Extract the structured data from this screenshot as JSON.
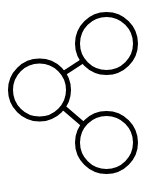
{
  "diagram": {
    "title": "share-network-diagram",
    "description": "Three outlined circles connected by two straight line segments forming a branching share icon",
    "type": "node-link",
    "canvas": {
      "width": 151,
      "height": 182
    },
    "colors": {
      "background": "#ffffff",
      "stroke": "#000000"
    },
    "stroke_width": 5,
    "nodes": [
      {
        "id": "node-left",
        "name": "left-circle",
        "label": "",
        "cx": 39.5,
        "cy": 90,
        "r": 29,
        "stroke": "#000000",
        "stroke_width": 5,
        "fill": "none"
      },
      {
        "id": "node-top-right",
        "name": "top-right-circle",
        "label": "",
        "cx": 106.5,
        "cy": 43.5,
        "r": 29,
        "stroke": "#000000",
        "stroke_width": 5,
        "fill": "none"
      },
      {
        "id": "node-bottom-right",
        "name": "bottom-right-circle",
        "label": "",
        "cx": 106.5,
        "cy": 142.5,
        "r": 29,
        "stroke": "#000000",
        "stroke_width": 5,
        "fill": "none"
      }
    ],
    "edges": [
      {
        "id": "edge-left-to-top-right",
        "name": "upper-connector",
        "from": "node-left",
        "to": "node-top-right",
        "x1": 63.5,
        "y1": 73.5,
        "x2": 83.5,
        "y2": 60.5,
        "stroke": "#000000",
        "stroke_width": 5
      },
      {
        "id": "edge-left-to-bottom-right",
        "name": "lower-connector",
        "from": "node-left",
        "to": "node-bottom-right",
        "x1": 63.5,
        "y1": 107.5,
        "x2": 84.5,
        "y2": 125.5,
        "stroke": "#000000",
        "stroke_width": 5
      }
    ]
  }
}
